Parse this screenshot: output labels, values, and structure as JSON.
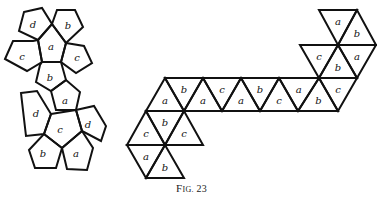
{
  "caption": "Fig. 23",
  "colors": {
    "stroke": "#111111",
    "background": "#ffffff"
  },
  "pentagon_net": {
    "description": "Dodecahedron net with faces labeled a-d",
    "faces": [
      {
        "id": "p1",
        "label": "d",
        "points": [
          [
            24,
            12
          ],
          [
            42,
            8
          ],
          [
            52,
            24
          ],
          [
            38,
            40
          ],
          [
            19,
            31
          ]
        ],
        "lx": 33,
        "ly": 25
      },
      {
        "id": "p2",
        "label": "b",
        "points": [
          [
            52,
            24
          ],
          [
            57,
            10
          ],
          [
            75,
            10
          ],
          [
            83,
            27
          ],
          [
            66,
            43
          ]
        ],
        "lx": 68,
        "ly": 26
      },
      {
        "id": "p3",
        "label": "a",
        "points": [
          [
            38,
            40
          ],
          [
            52,
            24
          ],
          [
            66,
            43
          ],
          [
            61,
            62
          ],
          [
            42,
            62
          ]
        ],
        "lx": 51,
        "ly": 47
      },
      {
        "id": "p4",
        "label": "c",
        "points": [
          [
            5,
            59
          ],
          [
            13,
            41
          ],
          [
            33,
            41
          ],
          [
            38,
            40
          ],
          [
            42,
            62
          ],
          [
            27,
            71
          ]
        ],
        "lx": 22,
        "ly": 57
      },
      {
        "id": "p5",
        "label": "c",
        "points": [
          [
            66,
            43
          ],
          [
            84,
            46
          ],
          [
            92,
            63
          ],
          [
            76,
            73
          ],
          [
            61,
            62
          ]
        ],
        "lx": 77,
        "ly": 58
      },
      {
        "id": "p6",
        "label": "b",
        "points": [
          [
            42,
            62
          ],
          [
            61,
            62
          ],
          [
            66,
            80
          ],
          [
            51,
            91
          ],
          [
            36,
            82
          ],
          [
            40,
            65
          ]
        ],
        "lx": 50,
        "ly": 78
      },
      {
        "id": "p7",
        "label": "a",
        "points": [
          [
            51,
            91
          ],
          [
            66,
            80
          ],
          [
            80,
            92
          ],
          [
            76,
            110
          ],
          [
            56,
            110
          ]
        ],
        "lx": 65,
        "ly": 101
      },
      {
        "id": "p8",
        "label": "d",
        "points": [
          [
            21,
            93
          ],
          [
            37,
            91
          ],
          [
            51,
            114
          ],
          [
            44,
            134
          ],
          [
            26,
            136
          ]
        ],
        "lx": 36,
        "ly": 114
      },
      {
        "id": "p9",
        "label": "c",
        "points": [
          [
            51,
            114
          ],
          [
            76,
            110
          ],
          [
            82,
            131
          ],
          [
            62,
            148
          ],
          [
            44,
            134
          ]
        ],
        "lx": 60,
        "ly": 130
      },
      {
        "id": "p10",
        "label": "d",
        "points": [
          [
            76,
            110
          ],
          [
            94,
            106
          ],
          [
            106,
            126
          ],
          [
            101,
            141
          ],
          [
            82,
            131
          ]
        ],
        "lx": 88,
        "ly": 125
      },
      {
        "id": "p11",
        "label": "b",
        "points": [
          [
            29,
            150
          ],
          [
            44,
            134
          ],
          [
            62,
            148
          ],
          [
            56,
            168
          ],
          [
            35,
            168
          ]
        ],
        "lx": 43,
        "ly": 154
      },
      {
        "id": "p12",
        "label": "a",
        "points": [
          [
            62,
            148
          ],
          [
            82,
            131
          ],
          [
            93,
            148
          ],
          [
            87,
            170
          ],
          [
            67,
            169
          ]
        ],
        "lx": 76,
        "ly": 154
      }
    ]
  },
  "triangle_net": {
    "description": "Icosahedron-style net of triangles labeled a-c",
    "faces": [
      {
        "label": "a",
        "points": [
          [
            319,
            10
          ],
          [
            357,
            10
          ],
          [
            338,
            45
          ]
        ]
      },
      {
        "label": "b",
        "points": [
          [
            357,
            10
          ],
          [
            338,
            45
          ],
          [
            376,
            45
          ]
        ]
      },
      {
        "label": "c",
        "points": [
          [
            300,
            45
          ],
          [
            338,
            45
          ],
          [
            319,
            78
          ]
        ]
      },
      {
        "label": "b",
        "points": [
          [
            338,
            45
          ],
          [
            319,
            78
          ],
          [
            357,
            78
          ]
        ]
      },
      {
        "label": "a",
        "points": [
          [
            338,
            45
          ],
          [
            376,
            45
          ],
          [
            357,
            78
          ]
        ]
      },
      {
        "label": "a",
        "points": [
          [
            165,
            78
          ],
          [
            146,
            111
          ],
          [
            184,
            111
          ]
        ]
      },
      {
        "label": "b",
        "points": [
          [
            165,
            78
          ],
          [
            203,
            78
          ],
          [
            184,
            111
          ]
        ]
      },
      {
        "label": "a",
        "points": [
          [
            203,
            78
          ],
          [
            184,
            111
          ],
          [
            222,
            111
          ]
        ]
      },
      {
        "label": "c",
        "points": [
          [
            203,
            78
          ],
          [
            241,
            78
          ],
          [
            222,
            111
          ]
        ]
      },
      {
        "label": "a",
        "points": [
          [
            241,
            78
          ],
          [
            222,
            111
          ],
          [
            260,
            111
          ]
        ]
      },
      {
        "label": "b",
        "points": [
          [
            241,
            78
          ],
          [
            279,
            78
          ],
          [
            260,
            111
          ]
        ]
      },
      {
        "label": "c",
        "points": [
          [
            279,
            78
          ],
          [
            260,
            111
          ],
          [
            298,
            111
          ]
        ]
      },
      {
        "label": "a",
        "points": [
          [
            279,
            78
          ],
          [
            319,
            78
          ],
          [
            298,
            111
          ]
        ]
      },
      {
        "label": "b",
        "points": [
          [
            319,
            78
          ],
          [
            298,
            111
          ],
          [
            338,
            111
          ]
        ]
      },
      {
        "label": "c",
        "points": [
          [
            319,
            78
          ],
          [
            357,
            78
          ],
          [
            338,
            111
          ]
        ]
      },
      {
        "label": "c",
        "points": [
          [
            146,
            111
          ],
          [
            127,
            145
          ],
          [
            165,
            145
          ]
        ]
      },
      {
        "label": "b",
        "points": [
          [
            146,
            111
          ],
          [
            184,
            111
          ],
          [
            165,
            145
          ]
        ]
      },
      {
        "label": "c",
        "points": [
          [
            184,
            111
          ],
          [
            165,
            145
          ],
          [
            203,
            145
          ]
        ]
      },
      {
        "label": "a",
        "points": [
          [
            127,
            145
          ],
          [
            165,
            145
          ],
          [
            146,
            178
          ]
        ]
      },
      {
        "label": "b",
        "points": [
          [
            165,
            145
          ],
          [
            146,
            178
          ],
          [
            184,
            178
          ]
        ]
      }
    ]
  }
}
